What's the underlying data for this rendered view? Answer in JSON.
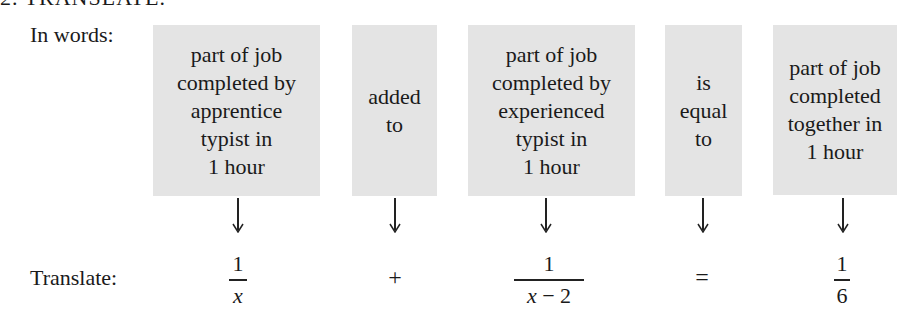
{
  "heading": "2.   TRANSLATE.",
  "labels": {
    "in_words": "In words:",
    "translate": "Translate:"
  },
  "boxes": [
    {
      "text": "part of job\ncompleted by\napprentice\ntypist in\n1 hour"
    },
    {
      "text": "added\nto"
    },
    {
      "text": "part of job\ncompleted by\nexperienced\ntypist in\n1 hour"
    },
    {
      "text": "is\nequal\nto"
    },
    {
      "text": "part of job\ncompleted\ntogether in\n1 hour"
    }
  ],
  "translation": {
    "term1": {
      "numerator": "1",
      "denominator": "x"
    },
    "op1": "+",
    "term2": {
      "numerator": "1",
      "denominator_var": "x",
      "denominator_rest": " − 2"
    },
    "op2": "=",
    "term3": {
      "numerator": "1",
      "denominator": "6"
    }
  },
  "colors": {
    "box_background": "#e4e4e4",
    "text": "#1a1a1a"
  }
}
